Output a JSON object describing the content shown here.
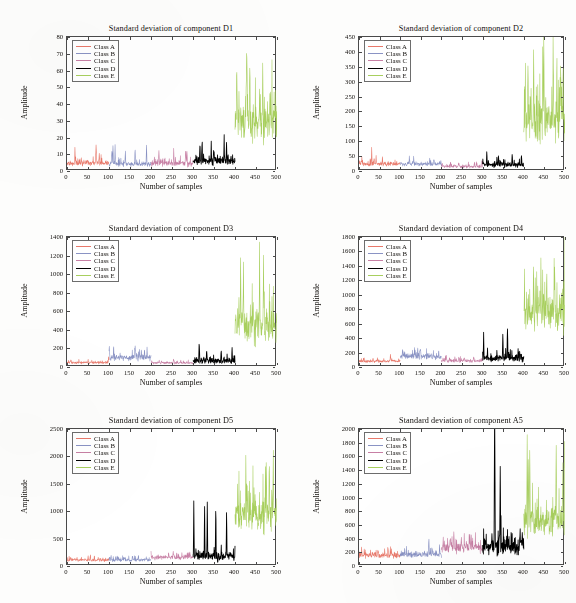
{
  "figure": {
    "title_prefix": "Standard deviation of component",
    "xlabel": "Number of samples",
    "ylabel": "Amplitude",
    "rows": 3,
    "cols": 2
  },
  "legend": {
    "entries": [
      {
        "label": "Class A",
        "color": "#e8796b"
      },
      {
        "label": "Class B",
        "color": "#8a93c4"
      },
      {
        "label": "Class C",
        "color": "#c77fa4"
      },
      {
        "label": "Class D",
        "color": "#000000"
      },
      {
        "label": "Class E",
        "color": "#a8cf5e"
      }
    ]
  },
  "chart_data": [
    {
      "type": "line",
      "title": "Standard deviation of component D1",
      "xlabel": "Number of samples",
      "ylabel": "Amplitude",
      "xlim": [
        0,
        500
      ],
      "ylim": [
        0,
        80
      ],
      "xticks": [
        0,
        50,
        100,
        150,
        200,
        250,
        300,
        350,
        400,
        450,
        500
      ],
      "yticks": [
        0,
        10,
        20,
        30,
        40,
        50,
        60,
        70,
        80
      ],
      "grid": false,
      "legend_position": "upper left",
      "series": [
        {
          "name": "Class A",
          "color": "#e8796b",
          "x_range": [
            0,
            100
          ],
          "baseline": 4.5,
          "noise": 2.2,
          "peak": 13,
          "seed": 11
        },
        {
          "name": "Class B",
          "color": "#8a93c4",
          "x_range": [
            100,
            200
          ],
          "baseline": 4.0,
          "noise": 2.0,
          "peak": 16,
          "seed": 22
        },
        {
          "name": "Class C",
          "color": "#c77fa4",
          "x_range": [
            200,
            300
          ],
          "baseline": 4.2,
          "noise": 2.4,
          "peak": 12,
          "seed": 33
        },
        {
          "name": "Class D",
          "color": "#000000",
          "x_range": [
            300,
            400
          ],
          "baseline": 5.5,
          "noise": 3.0,
          "peak": 17,
          "seed": 44
        },
        {
          "name": "Class E",
          "color": "#a8cf5e",
          "x_range": [
            400,
            500
          ],
          "baseline": 28,
          "noise": 17,
          "peak": 72,
          "seed": 55
        }
      ]
    },
    {
      "type": "line",
      "title": "Standard deviation of component D2",
      "xlabel": "Number of samples",
      "ylabel": "Amplitude",
      "xlim": [
        0,
        500
      ],
      "ylim": [
        0,
        450
      ],
      "xticks": [
        0,
        50,
        100,
        150,
        200,
        250,
        300,
        350,
        400,
        450,
        500
      ],
      "yticks": [
        0,
        50,
        100,
        150,
        200,
        250,
        300,
        350,
        400,
        450
      ],
      "grid": false,
      "legend_position": "upper left",
      "series": [
        {
          "name": "Class A",
          "color": "#e8796b",
          "x_range": [
            0,
            100
          ],
          "baseline": 22,
          "noise": 10,
          "peak": 46,
          "seed": 12
        },
        {
          "name": "Class B",
          "color": "#8a93c4",
          "x_range": [
            100,
            200
          ],
          "baseline": 22,
          "noise": 9,
          "peak": 44,
          "seed": 23
        },
        {
          "name": "Class C",
          "color": "#c77fa4",
          "x_range": [
            200,
            300
          ],
          "baseline": 14,
          "noise": 7,
          "peak": 32,
          "seed": 34
        },
        {
          "name": "Class D",
          "color": "#000000",
          "x_range": [
            300,
            400
          ],
          "baseline": 20,
          "noise": 12,
          "peak": 62,
          "seed": 45
        },
        {
          "name": "Class E",
          "color": "#a8cf5e",
          "x_range": [
            400,
            500
          ],
          "baseline": 160,
          "noise": 105,
          "peak": 430,
          "seed": 56
        }
      ]
    },
    {
      "type": "line",
      "title": "Standard deviation of component D3",
      "xlabel": "Number of samples",
      "ylabel": "Amplitude",
      "xlim": [
        0,
        500
      ],
      "ylim": [
        0,
        1400
      ],
      "xticks": [
        0,
        50,
        100,
        150,
        200,
        250,
        300,
        350,
        400,
        450,
        500
      ],
      "yticks": [
        0,
        200,
        400,
        600,
        800,
        1000,
        1200,
        1400
      ],
      "grid": false,
      "legend_position": "upper left",
      "series": [
        {
          "name": "Class A",
          "color": "#e8796b",
          "x_range": [
            0,
            100
          ],
          "baseline": 45,
          "noise": 18,
          "peak": 85,
          "seed": 13
        },
        {
          "name": "Class B",
          "color": "#8a93c4",
          "x_range": [
            100,
            200
          ],
          "baseline": 95,
          "noise": 50,
          "peak": 200,
          "seed": 24
        },
        {
          "name": "Class C",
          "color": "#c77fa4",
          "x_range": [
            200,
            300
          ],
          "baseline": 42,
          "noise": 18,
          "peak": 80,
          "seed": 35
        },
        {
          "name": "Class D",
          "color": "#000000",
          "x_range": [
            300,
            400
          ],
          "baseline": 62,
          "noise": 42,
          "peak": 215,
          "seed": 46
        },
        {
          "name": "Class E",
          "color": "#a8cf5e",
          "x_range": [
            400,
            500
          ],
          "baseline": 400,
          "noise": 270,
          "peak": 1220,
          "seed": 57
        }
      ]
    },
    {
      "type": "line",
      "title": "Standard deviation of component D4",
      "xlabel": "Number of samples",
      "ylabel": "Amplitude",
      "xlim": [
        0,
        500
      ],
      "ylim": [
        0,
        1800
      ],
      "xticks": [
        0,
        50,
        100,
        150,
        200,
        250,
        300,
        350,
        400,
        450,
        500
      ],
      "yticks": [
        0,
        200,
        400,
        600,
        800,
        1000,
        1200,
        1400,
        1600,
        1800
      ],
      "grid": false,
      "legend_position": "upper left",
      "series": [
        {
          "name": "Class A",
          "color": "#e8796b",
          "x_range": [
            0,
            100
          ],
          "baseline": 78,
          "noise": 26,
          "peak": 130,
          "seed": 14
        },
        {
          "name": "Class B",
          "color": "#8a93c4",
          "x_range": [
            100,
            200
          ],
          "baseline": 140,
          "noise": 62,
          "peak": 255,
          "seed": 25
        },
        {
          "name": "Class C",
          "color": "#c77fa4",
          "x_range": [
            200,
            300
          ],
          "baseline": 80,
          "noise": 30,
          "peak": 150,
          "seed": 36
        },
        {
          "name": "Class D",
          "color": "#000000",
          "x_range": [
            300,
            400
          ],
          "baseline": 115,
          "noise": 75,
          "peak": 515,
          "seed": 47
        },
        {
          "name": "Class E",
          "color": "#a8cf5e",
          "x_range": [
            400,
            500
          ],
          "baseline": 720,
          "noise": 370,
          "peak": 1500,
          "seed": 58
        }
      ]
    },
    {
      "type": "line",
      "title": "Standard deviation of component D5",
      "xlabel": "Number of samples",
      "ylabel": "Amplitude",
      "xlim": [
        0,
        500
      ],
      "ylim": [
        0,
        2500
      ],
      "xticks": [
        0,
        50,
        100,
        150,
        200,
        250,
        300,
        350,
        400,
        450,
        500
      ],
      "yticks": [
        0,
        500,
        1000,
        1500,
        2000,
        2500
      ],
      "grid": false,
      "legend_position": "upper left",
      "series": [
        {
          "name": "Class A",
          "color": "#e8796b",
          "x_range": [
            0,
            100
          ],
          "baseline": 105,
          "noise": 40,
          "peak": 185,
          "seed": 15
        },
        {
          "name": "Class B",
          "color": "#8a93c4",
          "x_range": [
            100,
            200
          ],
          "baseline": 105,
          "noise": 42,
          "peak": 190,
          "seed": 26
        },
        {
          "name": "Class C",
          "color": "#c77fa4",
          "x_range": [
            200,
            300
          ],
          "baseline": 150,
          "noise": 62,
          "peak": 265,
          "seed": 37
        },
        {
          "name": "Class D",
          "color": "#000000",
          "x_range": [
            300,
            400
          ],
          "baseline": 165,
          "noise": 120,
          "peak": 1205,
          "seed": 48
        },
        {
          "name": "Class E",
          "color": "#a8cf5e",
          "x_range": [
            400,
            500
          ],
          "baseline": 880,
          "noise": 490,
          "peak": 2240,
          "seed": 59
        }
      ]
    },
    {
      "type": "line",
      "title": "Standard deviation of component A5",
      "xlabel": "Number of samples",
      "ylabel": "Amplitude",
      "xlim": [
        0,
        500
      ],
      "ylim": [
        0,
        2000
      ],
      "xticks": [
        0,
        50,
        100,
        150,
        200,
        250,
        300,
        350,
        400,
        450,
        500
      ],
      "yticks": [
        0,
        200,
        400,
        600,
        800,
        1000,
        1200,
        1400,
        1600,
        1800,
        2000
      ],
      "grid": false,
      "legend_position": "upper left",
      "series": [
        {
          "name": "Class A",
          "color": "#e8796b",
          "x_range": [
            0,
            100
          ],
          "baseline": 150,
          "noise": 58,
          "peak": 255,
          "seed": 16
        },
        {
          "name": "Class B",
          "color": "#8a93c4",
          "x_range": [
            100,
            200
          ],
          "baseline": 160,
          "noise": 60,
          "peak": 330,
          "seed": 27
        },
        {
          "name": "Class C",
          "color": "#c77fa4",
          "x_range": [
            200,
            300
          ],
          "baseline": 250,
          "noise": 95,
          "peak": 470,
          "seed": 38
        },
        {
          "name": "Class D",
          "color": "#000000",
          "x_range": [
            300,
            400
          ],
          "baseline": 270,
          "noise": 210,
          "peak": 1955,
          "seed": 49
        },
        {
          "name": "Class E",
          "color": "#a8cf5e",
          "x_range": [
            400,
            500
          ],
          "baseline": 640,
          "noise": 340,
          "peak": 1860,
          "seed": 60
        }
      ]
    }
  ]
}
